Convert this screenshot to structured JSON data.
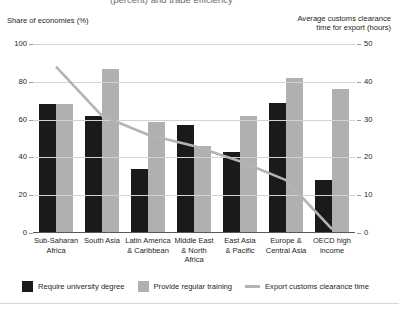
{
  "title": "(percent) and trade efficiency",
  "axes": {
    "left_caption": "Share of economies (%)",
    "right_caption_line1": "Average customs clearance",
    "right_caption_line2": "time for export (hours)",
    "left_ticks": [
      "100",
      "80",
      "60",
      "40",
      "20",
      "0"
    ],
    "right_ticks": [
      "50",
      "40",
      "30",
      "20",
      "10",
      "0"
    ]
  },
  "legend": {
    "items": [
      {
        "label": "Require university degree",
        "swatch": "dark",
        "color": "#1a1a1a"
      },
      {
        "label": "Provide regular training",
        "swatch": "light",
        "color": "#b0b0b0"
      },
      {
        "label": "Export customs clearance time",
        "swatch": "line",
        "color": "#b5b3b4"
      }
    ]
  },
  "chart_data": {
    "type": "bar",
    "title": "(percent) and trade efficiency",
    "xlabel": "",
    "ylabel": "Share of economies (%)",
    "ylim": [
      0,
      100
    ],
    "y2label": "Average customs clearance time for export (hours)",
    "y2lim": [
      0,
      50
    ],
    "grid": true,
    "legend_position": "bottom",
    "categories": [
      "Sub-Saharan Africa",
      "South Asia",
      "Latin America & Caribbean",
      "Middle East & North Africa",
      "East Asia & Pacific",
      "Europe & Central Asia",
      "OECD high income"
    ],
    "category_lines": [
      [
        "Sub-Saharan",
        "Africa"
      ],
      [
        "South Asia",
        ""
      ],
      [
        "Latin America",
        "& Caribbean"
      ],
      [
        "Middle East",
        "& North Africa"
      ],
      [
        "East Asia",
        "& Pacific"
      ],
      [
        "Europe &",
        "Central Asia"
      ],
      [
        "OECD high",
        "income"
      ]
    ],
    "series": [
      {
        "name": "Require university degree",
        "axis": "left",
        "type": "bar",
        "color": "#1a1a1a",
        "values": [
          68,
          62,
          34,
          57,
          43,
          69,
          28
        ]
      },
      {
        "name": "Provide regular training",
        "axis": "left",
        "type": "bar",
        "color": "#b0b0b0",
        "values": [
          68,
          87,
          59,
          46,
          62,
          82,
          76
        ]
      },
      {
        "name": "Export customs clearance time",
        "axis": "right",
        "type": "line",
        "color": "#b5b3b4",
        "values": [
          44,
          31,
          26,
          23,
          19,
          14,
          1
        ]
      }
    ]
  }
}
